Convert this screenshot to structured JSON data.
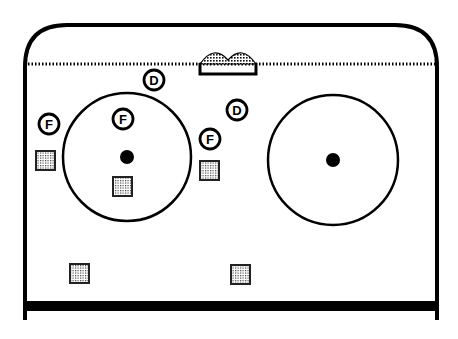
{
  "diagram": {
    "type": "hockey-zone-faceoff-positions",
    "rink": {
      "boards": {
        "left": 25,
        "right": 437,
        "top": 25,
        "corner_radius": 42,
        "bottom_wall_y": 320
      },
      "goal_line_y": 64,
      "blue_line_y": 306
    },
    "goal": {
      "x": 200,
      "y": 56,
      "width": 56,
      "height": 18
    },
    "faceoff_circles": [
      {
        "id": "left",
        "cx": 127,
        "cy": 157,
        "r": 64,
        "dot_r": 7
      },
      {
        "id": "right",
        "cx": 333,
        "cy": 160,
        "r": 65,
        "dot_r": 7
      }
    ],
    "players": [
      {
        "label": "D",
        "role": "defense",
        "x": 154,
        "y": 80
      },
      {
        "label": "D",
        "role": "defense",
        "x": 237,
        "y": 110
      },
      {
        "label": "F",
        "role": "forward",
        "x": 49,
        "y": 124
      },
      {
        "label": "F",
        "role": "forward",
        "x": 123,
        "y": 119
      },
      {
        "label": "F",
        "role": "forward",
        "x": 210,
        "y": 139
      }
    ],
    "opponents": [
      {
        "x": 45,
        "y": 160
      },
      {
        "x": 122,
        "y": 186
      },
      {
        "x": 209,
        "y": 170
      },
      {
        "x": 79,
        "y": 273
      },
      {
        "x": 240,
        "y": 274
      }
    ],
    "colors": {
      "ink": "#000000",
      "background": "#ffffff",
      "fill_pattern": "#9a9a9a"
    }
  }
}
